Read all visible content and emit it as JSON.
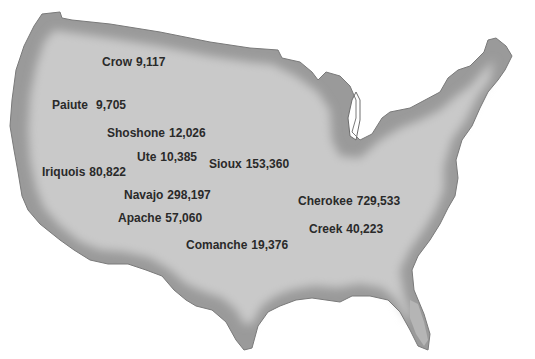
{
  "map": {
    "region": "United States (contiguous)",
    "colors": {
      "land_outer": "#9a9a9a",
      "land_inner": "#c9c9c9",
      "text": "#2a2a2a",
      "background": "#ffffff"
    },
    "labels": [
      {
        "name": "Crow",
        "population": "9,117",
        "x": 102,
        "y": 55
      },
      {
        "name": "Paiute",
        "population": "9,705",
        "x": 52,
        "y": 98
      },
      {
        "name": "Shoshone",
        "population": "12,026",
        "x": 107,
        "y": 126
      },
      {
        "name": "Ute",
        "population": "10,385",
        "x": 137,
        "y": 150
      },
      {
        "name": "Sioux",
        "population": "153,360",
        "x": 209,
        "y": 157
      },
      {
        "name": "Iriquois",
        "population": "80,822",
        "x": 42,
        "y": 165
      },
      {
        "name": "Navajo",
        "population": "298,197",
        "x": 124,
        "y": 188
      },
      {
        "name": "Apache",
        "population": "57,060",
        "x": 118,
        "y": 211
      },
      {
        "name": "Cherokee",
        "population": "729,533",
        "x": 298,
        "y": 194
      },
      {
        "name": "Creek",
        "population": "40,223",
        "x": 309,
        "y": 222
      },
      {
        "name": "Comanche",
        "population": "19,376",
        "x": 186,
        "y": 238
      }
    ]
  }
}
